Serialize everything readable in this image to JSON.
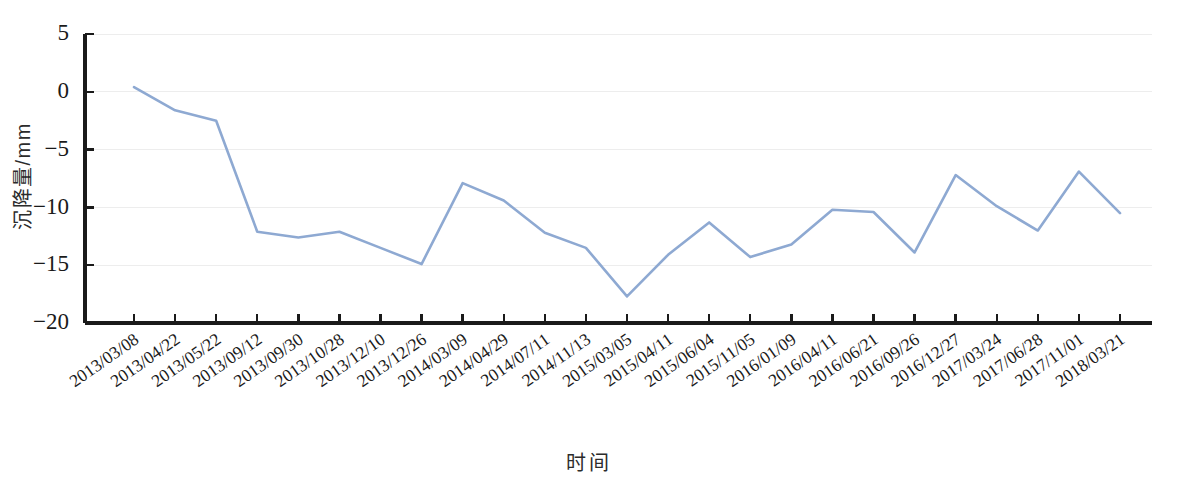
{
  "chart_data": {
    "type": "line",
    "title": "",
    "xlabel": "时间",
    "ylabel": "沉降量/mm",
    "ylim": [
      -20,
      5
    ],
    "ytick_values": [
      5,
      0,
      -5,
      -10,
      -15,
      -20
    ],
    "ytick_labels": [
      "5",
      "0",
      "-5",
      "-10",
      "-15",
      "-20"
    ],
    "grid": true,
    "grid_axis": "y",
    "legend": null,
    "legend_position": "none",
    "line_color": "#8EA9D2",
    "categories": [
      "2013/03/08",
      "2013/04/22",
      "2013/05/22",
      "2013/09/12",
      "2013/09/30",
      "2013/10/28",
      "2013/12/10",
      "2013/12/26",
      "2014/03/09",
      "2014/04/29",
      "2014/07/11",
      "2014/11/13",
      "2015/03/05",
      "2015/04/11",
      "2015/06/04",
      "2015/11/05",
      "2016/01/09",
      "2016/04/11",
      "2016/06/21",
      "2016/09/26",
      "2016/12/27",
      "2017/03/24",
      "2017/06/28",
      "2017/11/01",
      "2018/03/21"
    ],
    "series": [
      {
        "name": "沉降量",
        "values": [
          0.4,
          -1.6,
          -2.5,
          -12.1,
          -12.6,
          -12.1,
          -13.5,
          -14.9,
          -7.9,
          -9.4,
          -12.2,
          -13.5,
          -17.7,
          -14.1,
          -11.3,
          -14.3,
          -13.2,
          -10.2,
          -10.4,
          -13.9,
          -7.2,
          -9.9,
          -12.0,
          -6.9,
          -10.5
        ]
      }
    ]
  }
}
